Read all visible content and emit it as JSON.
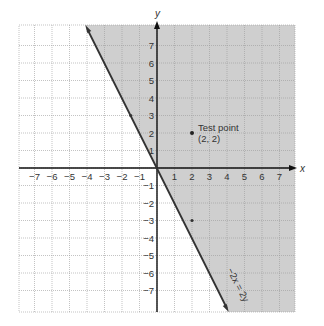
{
  "chart_data": {
    "type": "line",
    "title": "",
    "xlabel": "x",
    "ylabel": "y",
    "xlim": [
      -7.9,
      7.9
    ],
    "ylim": [
      -8.2,
      8.2
    ],
    "grid": true,
    "x_ticks": [
      -7,
      -6,
      -5,
      -4,
      -3,
      -2,
      -1,
      1,
      2,
      3,
      4,
      5,
      6,
      7
    ],
    "y_ticks": [
      -7,
      -6,
      -5,
      -4,
      -3,
      -2,
      -1,
      1,
      2,
      3,
      4,
      5,
      6,
      7
    ],
    "x_tick_labels": [
      "−7",
      "−6",
      "−5",
      "−4",
      "−3",
      "−2",
      "−1",
      "1",
      "2",
      "3",
      "4",
      "5",
      "6",
      "7"
    ],
    "y_tick_labels": [
      "−7",
      "−6",
      "−5",
      "−4",
      "−3",
      "−2",
      "−1",
      "1",
      "2",
      "3",
      "4",
      "5",
      "6",
      "7"
    ],
    "series": [
      {
        "name": "-2x = y",
        "equation": "y = -2x",
        "x": [
          -4.1,
          -2,
          0,
          2,
          4.1
        ],
        "y": [
          8.2,
          4,
          0,
          -4,
          -8.2
        ],
        "marked_points": [
          [
            -1.5,
            3
          ],
          [
            2,
            -3
          ]
        ]
      }
    ],
    "shaded_region": {
      "description": "half-plane above/right of boundary line y = -2x",
      "inequality": "y >= -2x",
      "color": "#cfcfcf"
    },
    "points": [
      {
        "x": 2,
        "y": 2,
        "label": "Test point",
        "sublabel": "(2, 2)"
      }
    ],
    "annotations": [
      {
        "text": "−2x = 2y",
        "along_line": true,
        "position": [
          4.2,
          -6
        ]
      }
    ],
    "colors": {
      "shade": "#cfcfcf",
      "line": "#333333",
      "grid": "#9a9a9a",
      "axis": "#111111"
    }
  },
  "labels": {
    "x_axis": "x",
    "y_axis": "y",
    "test_point": "Test point",
    "test_point_coords": "(2, 2)",
    "line_label": "−2x = 2y"
  }
}
